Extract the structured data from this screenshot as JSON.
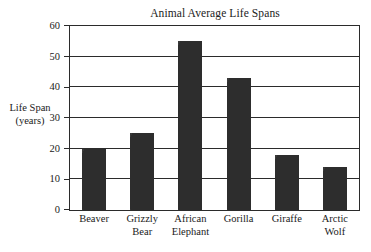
{
  "chart_data": {
    "type": "bar",
    "title": "Animal Average Life Spans",
    "xlabel": "",
    "ylabel": "Life Span (years)",
    "ylabel_lines": [
      "Life Span",
      "(years)"
    ],
    "categories": [
      "Beaver",
      "Grizzly Bear",
      "African Elephant",
      "Gorilla",
      "Giraffe",
      "Arctic Wolf"
    ],
    "category_lines": [
      [
        "Beaver"
      ],
      [
        "Grizzly",
        "Bear"
      ],
      [
        "African",
        "Elephant"
      ],
      [
        "Gorilla"
      ],
      [
        "Giraffe"
      ],
      [
        "Arctic",
        "Wolf"
      ]
    ],
    "values": [
      20,
      25,
      55,
      43,
      18,
      14
    ],
    "ylim": [
      0,
      60
    ],
    "yticks": [
      0,
      10,
      20,
      30,
      40,
      50,
      60
    ],
    "ytick_labels": [
      "0",
      "10",
      "20",
      "30",
      "40",
      "50",
      "60"
    ],
    "grid": "horizontal",
    "legend": "none",
    "bar_color": "#2d2d2d",
    "axis_color": "#2b2b2b",
    "background": "#ffffff"
  }
}
